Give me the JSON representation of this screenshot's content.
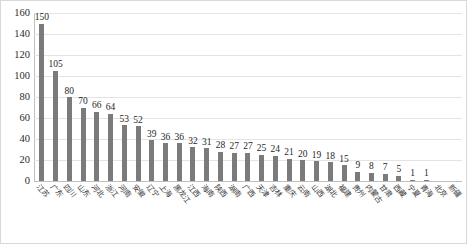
{
  "chart_data": {
    "type": "bar",
    "title": "",
    "subtitle": "",
    "xlabel": "",
    "ylabel": "",
    "ylim": [
      0,
      160
    ],
    "y_ticks": [
      0,
      20,
      40,
      60,
      80,
      100,
      120,
      140,
      160
    ],
    "grid": true,
    "legend": "none",
    "bar_color": "#7b7b7b",
    "gridline_color": "#e4e4e4",
    "axis_color": "#bfbfbf",
    "categories": [
      "江苏",
      "广东",
      "四川",
      "山东",
      "河北",
      "浙江",
      "河南",
      "安徽",
      "辽宁",
      "上海",
      "黑龙江",
      "江西",
      "海南",
      "陕西",
      "湖南",
      "广西",
      "天津",
      "吉林",
      "重庆",
      "云南",
      "山西",
      "湖北",
      "福建",
      "贵州",
      "内蒙古",
      "甘肃",
      "西藏",
      "宁夏",
      "青海",
      "北京",
      "新疆"
    ],
    "values": [
      150,
      105,
      80,
      70,
      66,
      64,
      53,
      52,
      39,
      36,
      36,
      32,
      31,
      28,
      27,
      27,
      25,
      24,
      21,
      20,
      19,
      18,
      15,
      9,
      8,
      7,
      5,
      1,
      1,
      0,
      0
    ]
  }
}
